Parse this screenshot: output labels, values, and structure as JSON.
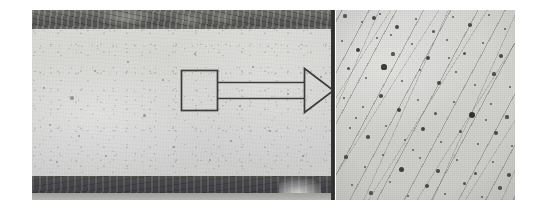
{
  "figure": {
    "kind": "two-panel-micrograph",
    "background_color": "#ffffff",
    "width": 534,
    "height": 208
  },
  "left_panel": {
    "name": "cross-section-macrograph",
    "x": 32,
    "y": 10,
    "width": 303,
    "height": 190,
    "matrix_color": "#d4d4d1",
    "top_band": {
      "label": "dark-surface-layer-top",
      "color": "#5a5a56",
      "y": 0,
      "height": 19
    },
    "bottom_band": {
      "label": "dark-surface-layer-bottom",
      "color": "#464649",
      "height": 17
    },
    "inclusions": [
      {
        "x": 12,
        "y": 78,
        "r": 1.4
      },
      {
        "x": 18,
        "y": 115,
        "r": 1.1
      },
      {
        "x": 40,
        "y": 88,
        "r": 1.6
      },
      {
        "x": 47,
        "y": 126,
        "r": 1.0
      },
      {
        "x": 63,
        "y": 61,
        "r": 1.2
      },
      {
        "x": 74,
        "y": 146,
        "r": 1.3
      },
      {
        "x": 96,
        "y": 52,
        "r": 1.0
      },
      {
        "x": 112,
        "y": 105,
        "r": 1.5
      },
      {
        "x": 131,
        "y": 70,
        "r": 1.1
      },
      {
        "x": 142,
        "y": 137,
        "r": 1.2
      },
      {
        "x": 163,
        "y": 44,
        "r": 1.0
      },
      {
        "x": 178,
        "y": 150,
        "r": 1.3
      },
      {
        "x": 199,
        "y": 131,
        "r": 1.1
      },
      {
        "x": 221,
        "y": 57,
        "r": 1.2
      },
      {
        "x": 238,
        "y": 121,
        "r": 1.4
      },
      {
        "x": 256,
        "y": 84,
        "r": 1.0
      },
      {
        "x": 271,
        "y": 146,
        "r": 1.2
      },
      {
        "x": 289,
        "y": 67,
        "r": 1.1
      },
      {
        "x": 300,
        "y": 113,
        "r": 1.3
      },
      {
        "x": 86,
        "y": 168,
        "r": 1.0
      },
      {
        "x": 208,
        "y": 96,
        "r": 1.0
      },
      {
        "x": 25,
        "y": 152,
        "r": 1.2
      }
    ]
  },
  "callout": {
    "name": "region-of-interest-callout",
    "box": {
      "label": "roi-box",
      "x": 181,
      "y": 70,
      "width": 36,
      "height": 40
    },
    "shaft": {
      "label": "arrow-shaft",
      "x1": 217,
      "y1": 82,
      "x2": 305,
      "y2": 98
    },
    "head": {
      "label": "arrow-head",
      "tip_x": 333,
      "tip_y": 90,
      "base_x": 304,
      "top_y": 68,
      "bottom_y": 112
    },
    "stroke_color": "#3c3c3a",
    "fill_color": "transparent",
    "stroke_width": 1.6
  },
  "divider": {
    "name": "panel-divider-rule",
    "x": 331,
    "y": 10,
    "width": 4,
    "height": 190,
    "color": "#2f2f2d"
  },
  "right_panel": {
    "name": "high-magnification-micrograph",
    "x": 336,
    "y": 10,
    "width": 179,
    "height": 190,
    "matrix_color": "#d6d6d3",
    "striation_angle_deg": 118,
    "striation_color": "#5f5f5c",
    "pore_color": "#2d2d2b",
    "pores": [
      {
        "x": 9,
        "y": 6,
        "r": 1.6
      },
      {
        "x": 26,
        "y": 12,
        "r": 1.1
      },
      {
        "x": 44,
        "y": 4,
        "r": 1.3
      },
      {
        "x": 61,
        "y": 17,
        "r": 2.1
      },
      {
        "x": 80,
        "y": 9,
        "r": 1.2
      },
      {
        "x": 97,
        "y": 21,
        "r": 1.5
      },
      {
        "x": 117,
        "y": 7,
        "r": 1.1
      },
      {
        "x": 134,
        "y": 15,
        "r": 1.8
      },
      {
        "x": 153,
        "y": 5,
        "r": 1.2
      },
      {
        "x": 169,
        "y": 19,
        "r": 1.4
      },
      {
        "x": 6,
        "y": 31,
        "r": 1.3
      },
      {
        "x": 22,
        "y": 40,
        "r": 2.4
      },
      {
        "x": 41,
        "y": 28,
        "r": 1.2
      },
      {
        "x": 57,
        "y": 44,
        "r": 1.6
      },
      {
        "x": 76,
        "y": 34,
        "r": 1.1
      },
      {
        "x": 92,
        "y": 48,
        "r": 2.0
      },
      {
        "x": 111,
        "y": 30,
        "r": 1.3
      },
      {
        "x": 128,
        "y": 43,
        "r": 1.5
      },
      {
        "x": 147,
        "y": 33,
        "r": 1.2
      },
      {
        "x": 165,
        "y": 46,
        "r": 1.7
      },
      {
        "x": 12,
        "y": 58,
        "r": 1.5
      },
      {
        "x": 30,
        "y": 68,
        "r": 1.2
      },
      {
        "x": 48,
        "y": 57,
        "r": 2.6
      },
      {
        "x": 66,
        "y": 71,
        "r": 1.3
      },
      {
        "x": 84,
        "y": 60,
        "r": 1.1
      },
      {
        "x": 103,
        "y": 73,
        "r": 1.9
      },
      {
        "x": 120,
        "y": 62,
        "r": 1.4
      },
      {
        "x": 139,
        "y": 75,
        "r": 1.2
      },
      {
        "x": 158,
        "y": 64,
        "r": 1.6
      },
      {
        "x": 174,
        "y": 77,
        "r": 1.3
      },
      {
        "x": 8,
        "y": 88,
        "r": 1.4
      },
      {
        "x": 27,
        "y": 97,
        "r": 1.2
      },
      {
        "x": 45,
        "y": 86,
        "r": 1.7
      },
      {
        "x": 63,
        "y": 100,
        "r": 2.2
      },
      {
        "x": 82,
        "y": 90,
        "r": 1.1
      },
      {
        "x": 99,
        "y": 103,
        "r": 1.5
      },
      {
        "x": 118,
        "y": 92,
        "r": 1.3
      },
      {
        "x": 136,
        "y": 105,
        "r": 3.0
      },
      {
        "x": 155,
        "y": 94,
        "r": 1.2
      },
      {
        "x": 171,
        "y": 107,
        "r": 1.6
      },
      {
        "x": 14,
        "y": 118,
        "r": 1.3
      },
      {
        "x": 32,
        "y": 127,
        "r": 1.8
      },
      {
        "x": 50,
        "y": 116,
        "r": 1.1
      },
      {
        "x": 69,
        "y": 130,
        "r": 1.4
      },
      {
        "x": 87,
        "y": 119,
        "r": 2.3
      },
      {
        "x": 105,
        "y": 132,
        "r": 1.2
      },
      {
        "x": 124,
        "y": 121,
        "r": 1.5
      },
      {
        "x": 142,
        "y": 134,
        "r": 1.3
      },
      {
        "x": 160,
        "y": 123,
        "r": 1.9
      },
      {
        "x": 176,
        "y": 136,
        "r": 1.1
      },
      {
        "x": 10,
        "y": 147,
        "r": 1.6
      },
      {
        "x": 29,
        "y": 157,
        "r": 1.2
      },
      {
        "x": 47,
        "y": 145,
        "r": 1.4
      },
      {
        "x": 65,
        "y": 159,
        "r": 2.5
      },
      {
        "x": 84,
        "y": 148,
        "r": 1.1
      },
      {
        "x": 102,
        "y": 161,
        "r": 1.7
      },
      {
        "x": 121,
        "y": 150,
        "r": 1.3
      },
      {
        "x": 139,
        "y": 163,
        "r": 1.5
      },
      {
        "x": 157,
        "y": 152,
        "r": 1.2
      },
      {
        "x": 173,
        "y": 165,
        "r": 1.8
      },
      {
        "x": 16,
        "y": 175,
        "r": 1.3
      },
      {
        "x": 35,
        "y": 183,
        "r": 1.6
      },
      {
        "x": 54,
        "y": 172,
        "r": 1.1
      },
      {
        "x": 72,
        "y": 186,
        "r": 1.4
      },
      {
        "x": 91,
        "y": 176,
        "r": 2.0
      },
      {
        "x": 109,
        "y": 184,
        "r": 1.2
      },
      {
        "x": 128,
        "y": 173,
        "r": 1.5
      },
      {
        "x": 146,
        "y": 187,
        "r": 1.3
      },
      {
        "x": 164,
        "y": 178,
        "r": 1.7
      },
      {
        "x": 38,
        "y": 8,
        "r": 2.2
      },
      {
        "x": 150,
        "y": 110,
        "r": 1.1
      },
      {
        "x": 20,
        "y": 108,
        "r": 1.2
      },
      {
        "x": 77,
        "y": 140,
        "r": 1.1
      },
      {
        "x": 113,
        "y": 48,
        "r": 1.3
      },
      {
        "x": 55,
        "y": 25,
        "r": 1.2
      }
    ]
  }
}
